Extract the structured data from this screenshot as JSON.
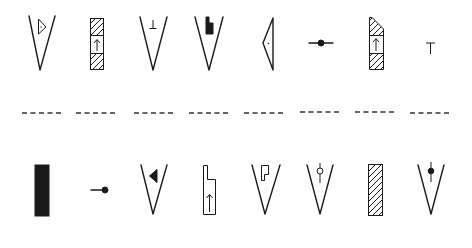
{
  "rows": {
    "top": {
      "symbols": [
        {
          "id": "v-with-triangle",
          "shape": "open V with small outlined triangle and dot"
        },
        {
          "id": "hatched-column-arrow",
          "shape": "three-segment rectangle, hatched top and bottom, up arrow in middle"
        },
        {
          "id": "v-with-tee",
          "shape": "open V with small inverted-T mark",
          "glyph": "⊥"
        },
        {
          "id": "v-with-filled-notch",
          "shape": "open V with filled stepped block"
        },
        {
          "id": "left-wedge",
          "shape": "left-pointing narrow triangle with center dot"
        },
        {
          "id": "line-dot",
          "shape": "horizontal line through filled dot"
        },
        {
          "id": "tapered-hatched-column-arrow",
          "shape": "tapered rectangle, hatched top and bottom, up arrow in middle"
        },
        {
          "id": "tee-glyph",
          "shape": "letter T",
          "glyph": "T"
        }
      ]
    },
    "separator": {
      "groups": 8,
      "style": "dashed"
    },
    "bottom": {
      "symbols": [
        {
          "id": "solid-column",
          "shape": "filled black rectangle"
        },
        {
          "id": "line-end-dot",
          "shape": "short line ending in filled dot"
        },
        {
          "id": "v-with-filled-triangle",
          "shape": "open V with filled left-pointing triangle"
        },
        {
          "id": "stepped-column-arrow",
          "shape": "narrow stepped outline with up arrow"
        },
        {
          "id": "v-with-p-block",
          "shape": "open V with P-shaped outline"
        },
        {
          "id": "v-with-open-circle",
          "shape": "open V with vertical line through open circle"
        },
        {
          "id": "hatched-column",
          "shape": "fully hatched rectangle"
        },
        {
          "id": "v-with-filled-dot",
          "shape": "open V with vertical line through filled dot"
        }
      ]
    }
  },
  "colors": {
    "ink": "#1a1a1a",
    "background": "#ffffff"
  }
}
